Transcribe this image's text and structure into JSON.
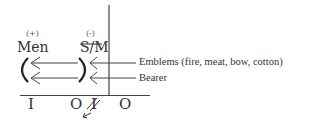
{
  "diagram": {
    "left_group": {
      "sign": "(+)",
      "label": "Men"
    },
    "right_group": {
      "sign": "(-)",
      "label": "S/M",
      "struck": true
    },
    "arrows": [
      {
        "label": "Emblems (fire, meat, bow, cotton)"
      },
      {
        "label": "Bearer"
      }
    ],
    "brackets": {
      "left": "(",
      "right": ")"
    },
    "baseline": {
      "marks": [
        "I",
        "O",
        "I",
        "O"
      ],
      "third_mark_struck": true,
      "small_arrow": "←"
    }
  }
}
